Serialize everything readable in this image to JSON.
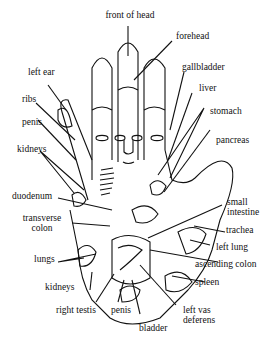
{
  "diagram": {
    "type": "hand reflexology map",
    "labels": {
      "front_of_head": "front of head",
      "forehead": "forehead",
      "gallbladder": "gallbladder",
      "liver": "liver",
      "stomach": "stomach",
      "pancreas": "pancreas",
      "left_ear": "left ear",
      "ribs": "ribs",
      "penis_top": "penis",
      "kidneys_top": "kidneys",
      "duodenum": "duodenum",
      "transverse_colon_1": "transverse",
      "transverse_colon_2": "colon",
      "small_intestine_1": "small",
      "small_intestine_2": "intestine",
      "trachea": "trachea",
      "left_lung": "left lung",
      "ascending_colon": "ascending colon",
      "spleen": "spleen",
      "lungs": "lungs",
      "kidneys_bottom": "kidneys",
      "right_testis": "right testis",
      "penis_bottom": "penis",
      "bladder": "bladder",
      "left_vas_1": "left vas",
      "left_vas_2": "deferens"
    }
  }
}
